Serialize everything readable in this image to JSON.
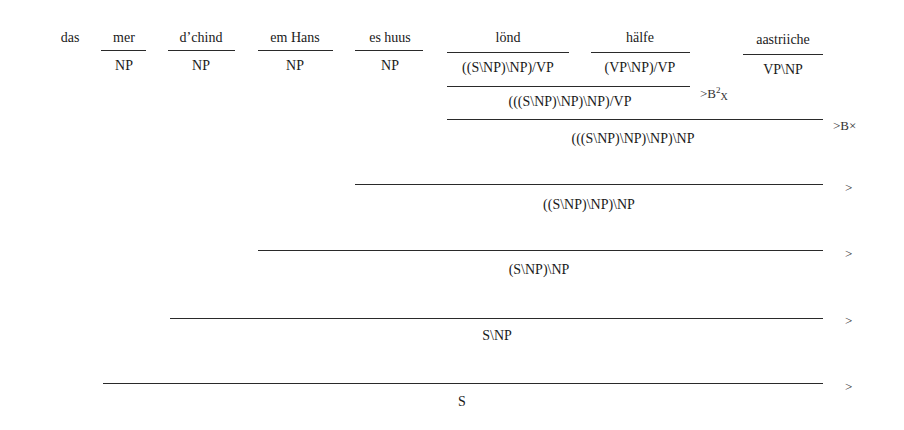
{
  "words": [
    {
      "text": "das",
      "category": ""
    },
    {
      "text": "mer",
      "category": "NP"
    },
    {
      "text": "d’chind",
      "category": "NP"
    },
    {
      "text": "em Hans",
      "category": "NP"
    },
    {
      "text": "es huus",
      "category": "NP"
    },
    {
      "text": "lönd",
      "category": "((S\\NP)\\NP)/VP"
    },
    {
      "text": "hälfe",
      "category": "(VP\\NP)/VP"
    },
    {
      "text": "aastriiche",
      "category": "VP\\NP"
    }
  ],
  "derivations": [
    {
      "result": "(((S\\NP)\\NP)\\NP)/VP",
      "rule": ">B",
      "rule_sup": "2",
      "rule_sub": "X"
    },
    {
      "result": "(((S\\NP)\\NP)\\NP)\\NP",
      "rule": ">B",
      "rule_sub": "×"
    },
    {
      "result": "((S\\NP)\\NP)\\NP",
      "rule": ">"
    },
    {
      "result": "(S\\NP)\\NP",
      "rule": ">"
    },
    {
      "result": "S\\NP",
      "rule": ">"
    },
    {
      "result": "S",
      "rule": ">"
    }
  ]
}
